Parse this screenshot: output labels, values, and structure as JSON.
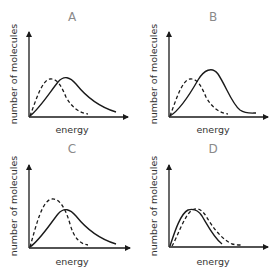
{
  "figure": {
    "panels": [
      {
        "id": "A",
        "letter": "A",
        "xlabel": "energy",
        "ylabel": "number of molecules",
        "description": "Dashed curve peaks earlier and at roughly same height as solid; solid curve peaks later with longer tail"
      },
      {
        "id": "B",
        "letter": "B",
        "xlabel": "energy",
        "ylabel": "number of molecules",
        "description": "Solid curve peaks later and higher than dashed curve"
      },
      {
        "id": "C",
        "letter": "C",
        "xlabel": "energy",
        "ylabel": "number of molecules",
        "description": "Dashed curve peaks earlier and higher than solid curve"
      },
      {
        "id": "D",
        "letter": "D",
        "xlabel": "energy",
        "ylabel": "number of molecules",
        "description": "Solid and dashed curves have the same peak height; dashed curve shifted slightly to higher energy"
      }
    ],
    "legend": {
      "solid": "solid line curve",
      "dashed": "dashed line curve"
    },
    "colors": {
      "line": "#1a1a1a",
      "letter": "#8a8a8a",
      "label": "#333333"
    }
  }
}
